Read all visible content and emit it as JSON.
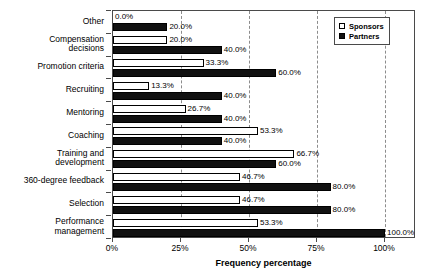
{
  "chart_data": {
    "type": "bar",
    "orientation": "horizontal",
    "title": "",
    "xlabel": "Frequency percentage",
    "ylabel": "",
    "xlim": [
      0,
      100
    ],
    "xticks": [
      "0%",
      "25%",
      "50%",
      "75%",
      "100%"
    ],
    "xtick_values": [
      0,
      25,
      50,
      75,
      100
    ],
    "grid": "vertical-dashed",
    "legend_position": "top-right",
    "categories": [
      "Other",
      "Compensation\ndecisions",
      "Promotion criteria",
      "Recruiting",
      "Mentoring",
      "Coaching",
      "Training and\ndevelopment",
      "360-degree feedback",
      "Selection",
      "Performance\nmanagement"
    ],
    "series": [
      {
        "name": "Sponsors",
        "color": "#ffffff",
        "values": [
          0.0,
          20.0,
          33.3,
          13.3,
          26.7,
          53.3,
          66.7,
          46.7,
          46.7,
          53.3
        ],
        "labels": [
          "0.0%",
          "20.0%",
          "33.3%",
          "13.3%",
          "26.7%",
          "53.3%",
          "66.7%",
          "46.7%",
          "46.7%",
          "53.3%"
        ]
      },
      {
        "name": "Partners",
        "color": "#111111",
        "values": [
          20.0,
          40.0,
          60.0,
          40.0,
          40.0,
          40.0,
          60.0,
          80.0,
          80.0,
          100.0
        ],
        "labels": [
          "20.0%",
          "40.0%",
          "60.0%",
          "40.0%",
          "40.0%",
          "40.0%",
          "60.0%",
          "80.0%",
          "80.0%",
          "100.0%"
        ]
      }
    ]
  },
  "legend": {
    "items": [
      {
        "label": "Sponsors",
        "swatch": "hollow-square-icon"
      },
      {
        "label": "Partners",
        "swatch": "filled-square-icon"
      }
    ]
  }
}
